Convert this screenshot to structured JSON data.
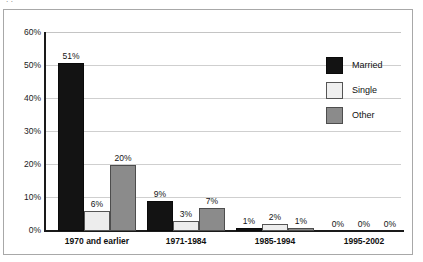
{
  "caption_fragment": "  .       .",
  "chart_data": {
    "type": "bar",
    "title": "",
    "subtitle": "",
    "xlabel": "",
    "ylabel": "",
    "ylim": [
      0,
      60
    ],
    "y_unit": "%",
    "grid": true,
    "legend_position": "right-top",
    "categories": [
      "1970 and earlier",
      "1971-1984",
      "1985-1994",
      "1995-2002"
    ],
    "series": [
      {
        "name": "Married",
        "color": "#131313",
        "values": [
          51,
          9,
          1,
          0
        ],
        "labels": [
          "51%",
          "9%",
          "1%",
          "0%"
        ]
      },
      {
        "name": "Single",
        "color": "#ededed",
        "values": [
          6,
          3,
          2,
          0
        ],
        "labels": [
          "6%",
          "3%",
          "2%",
          "0%"
        ]
      },
      {
        "name": "Other",
        "color": "#8b8b8b",
        "values": [
          20,
          7,
          1,
          0
        ],
        "labels": [
          "20%",
          "7%",
          "1%",
          "0%"
        ]
      }
    ],
    "y_ticks": [
      {
        "value": 60,
        "label": "60%"
      },
      {
        "value": 50,
        "label": "50%"
      },
      {
        "value": 40,
        "label": "40%"
      },
      {
        "value": 30,
        "label": "30%"
      },
      {
        "value": 20,
        "label": "20%"
      },
      {
        "value": 10,
        "label": "10%"
      },
      {
        "value": 0,
        "label": "0%"
      }
    ]
  },
  "legend": {
    "items": [
      {
        "label": "Married",
        "swatch": "married"
      },
      {
        "label": "Single",
        "swatch": "single"
      },
      {
        "label": "Other",
        "swatch": "other"
      }
    ]
  },
  "colors": {
    "married": "#131313",
    "single": "#ededed",
    "other": "#8b8b8b",
    "gridline": "#cfcfcf",
    "axis": "#1a1a1a",
    "frame": "#a8a8a8"
  }
}
